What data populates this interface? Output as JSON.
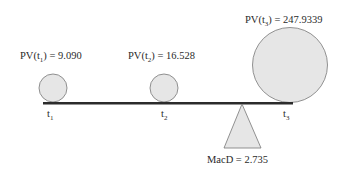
{
  "diagram": {
    "type": "seesaw-duration",
    "colors": {
      "beam": "#2b2b2b",
      "fill": "#e6e6e6",
      "stroke": "#777777"
    },
    "weights": [
      {
        "id": "t1",
        "pv_prefix": "PV(t",
        "pv_sub": "1",
        "pv_suffix": ") = 9.090",
        "time_label": "t",
        "time_sub": "1"
      },
      {
        "id": "t2",
        "pv_prefix": "PV(t",
        "pv_sub": "2",
        "pv_suffix": ") = 16.528",
        "time_label": "t",
        "time_sub": "2"
      },
      {
        "id": "t3",
        "pv_prefix": "PV(t",
        "pv_sub": "3",
        "pv_suffix": ") = 247.9339",
        "time_label": "t",
        "time_sub": "3"
      }
    ],
    "fulcrum": {
      "label": "MacD = 2.735"
    }
  }
}
